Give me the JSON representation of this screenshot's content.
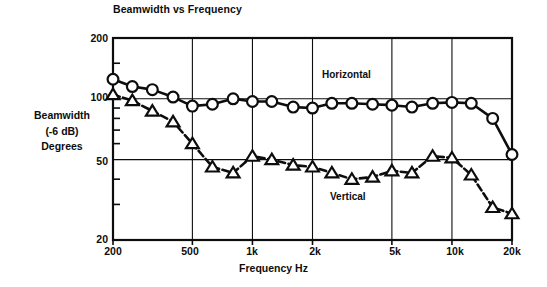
{
  "chart_data": {
    "type": "line",
    "title": "Beamwidth vs Frequency",
    "xlabel": "Frequency Hz",
    "ylabel": "Beamwidth\n(-6 dB)\nDegrees",
    "ylabel_lines": [
      "Beamwidth",
      "(-6 dB)",
      "Degrees"
    ],
    "xscale": "log",
    "yscale": "log",
    "xlim": [
      200,
      20000
    ],
    "ylim": [
      20,
      200
    ],
    "grid": true,
    "grid_x": [
      200,
      500,
      1000,
      2000,
      5000,
      10000,
      20000
    ],
    "grid_y": [
      20,
      50,
      100,
      200
    ],
    "xticks": [
      200,
      500,
      1000,
      2000,
      5000,
      10000,
      20000
    ],
    "xticklabels": [
      "200",
      "500",
      "1k",
      "2k",
      "5k",
      "10k",
      "20k"
    ],
    "yticks": [
      20,
      50,
      100,
      200
    ],
    "yticklabels": [
      "20",
      "50",
      "100",
      "200"
    ],
    "yminorticks": [
      30,
      40,
      60,
      70,
      80,
      90,
      150
    ],
    "legend_position": "inline-annotations",
    "series": [
      {
        "name": "Horizontal",
        "marker": "circle",
        "linestyle": "solid",
        "annotation": "Horizontal",
        "points": [
          {
            "x": 200,
            "y": 125
          },
          {
            "x": 250,
            "y": 115
          },
          {
            "x": 315,
            "y": 111
          },
          {
            "x": 400,
            "y": 102
          },
          {
            "x": 500,
            "y": 92
          },
          {
            "x": 630,
            "y": 94
          },
          {
            "x": 800,
            "y": 100
          },
          {
            "x": 1000,
            "y": 97
          },
          {
            "x": 1250,
            "y": 97
          },
          {
            "x": 1600,
            "y": 91
          },
          {
            "x": 2000,
            "y": 90
          },
          {
            "x": 2500,
            "y": 95
          },
          {
            "x": 3150,
            "y": 95
          },
          {
            "x": 4000,
            "y": 94
          },
          {
            "x": 5000,
            "y": 93
          },
          {
            "x": 6300,
            "y": 91
          },
          {
            "x": 8000,
            "y": 95
          },
          {
            "x": 10000,
            "y": 96
          },
          {
            "x": 12500,
            "y": 95
          },
          {
            "x": 16000,
            "y": 80
          },
          {
            "x": 20000,
            "y": 53
          }
        ]
      },
      {
        "name": "Vertical",
        "marker": "triangle",
        "linestyle": "dashed",
        "annotation": "Vertical",
        "points": [
          {
            "x": 200,
            "y": 105
          },
          {
            "x": 250,
            "y": 98
          },
          {
            "x": 315,
            "y": 87
          },
          {
            "x": 400,
            "y": 77
          },
          {
            "x": 500,
            "y": 60
          },
          {
            "x": 630,
            "y": 46
          },
          {
            "x": 800,
            "y": 43
          },
          {
            "x": 1000,
            "y": 52
          },
          {
            "x": 1250,
            "y": 50
          },
          {
            "x": 1600,
            "y": 47
          },
          {
            "x": 2000,
            "y": 46
          },
          {
            "x": 2500,
            "y": 43
          },
          {
            "x": 3150,
            "y": 40
          },
          {
            "x": 4000,
            "y": 41
          },
          {
            "x": 5000,
            "y": 44
          },
          {
            "x": 6300,
            "y": 43
          },
          {
            "x": 8000,
            "y": 52
          },
          {
            "x": 10000,
            "y": 51
          },
          {
            "x": 12500,
            "y": 42
          },
          {
            "x": 16000,
            "y": 29
          },
          {
            "x": 20000,
            "y": 27
          }
        ]
      }
    ],
    "colors": {
      "ink": "#0d0d0d",
      "background": "#ffffff",
      "grid": "#1a1a1a"
    }
  }
}
